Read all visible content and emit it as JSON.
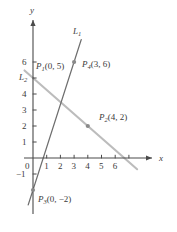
{
  "figure": {
    "type": "coordinate-graph",
    "axes": {
      "x_axis_label": "x",
      "y_axis_label": "y",
      "origin_label": "0",
      "x_ticks": [
        {
          "value": 1,
          "label": "1"
        },
        {
          "value": 2,
          "label": "2"
        },
        {
          "value": 3,
          "label": "3"
        },
        {
          "value": 4,
          "label": "4"
        },
        {
          "value": 5,
          "label": "5"
        },
        {
          "value": 6,
          "label": "6"
        },
        {
          "value": 7,
          "label": ""
        }
      ],
      "y_ticks": [
        {
          "value": -1,
          "label": "−1"
        },
        {
          "value": 1,
          "label": "1"
        },
        {
          "value": 2,
          "label": "2"
        },
        {
          "value": 3,
          "label": "3"
        },
        {
          "value": 4,
          "label": "4"
        },
        {
          "value": 5,
          "label": ""
        },
        {
          "value": 6,
          "label": "6"
        }
      ],
      "xlim": [
        -0.6,
        7.9
      ],
      "ylim": [
        -3.1,
        7.4
      ]
    },
    "lines": [
      {
        "id": "L1",
        "label_base": "L",
        "label_sub": "1",
        "color": "#6e6e6e",
        "width": 1.3,
        "through": [
          [
            0,
            -2
          ],
          [
            3,
            6
          ]
        ],
        "draw_from": [
          -0.35,
          -2.93
        ],
        "draw_to": [
          3.52,
          7.4
        ]
      },
      {
        "id": "L2",
        "label_base": "L",
        "label_sub": "2",
        "color": "#bcbcbc",
        "width": 2.1,
        "through": [
          [
            0,
            5
          ],
          [
            4,
            2
          ]
        ],
        "draw_from": [
          -0.62,
          5.47
        ],
        "draw_to": [
          7.6,
          -0.7
        ]
      }
    ],
    "points": [
      {
        "id": "P1",
        "label_base": "P",
        "label_sub": "1",
        "label_coords": "(0, 5)",
        "x": 0,
        "y": 5,
        "marker": false
      },
      {
        "id": "P2",
        "label_base": "P",
        "label_sub": "2",
        "label_coords": "(4, 2)",
        "x": 4,
        "y": 2,
        "marker": true
      },
      {
        "id": "P3",
        "label_base": "P",
        "label_sub": "3",
        "label_coords": "(0, −2)",
        "x": 0,
        "y": -2,
        "marker": true
      },
      {
        "id": "P4",
        "label_base": "P",
        "label_sub": "4",
        "label_coords": "(3, 6)",
        "x": 3,
        "y": 6,
        "marker": true
      }
    ],
    "colors": {
      "axis": "#4a4a4a",
      "text": "#3b3b3b",
      "line1": "#6e6e6e",
      "line2": "#bcbcbc",
      "marker": "#8a8a8a",
      "background": "#ffffff"
    }
  }
}
